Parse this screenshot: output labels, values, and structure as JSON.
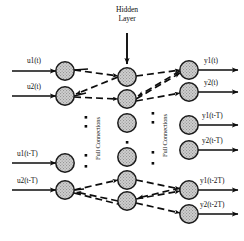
{
  "figure": {
    "title_line1": "Hidden",
    "title_line2": "Layer",
    "background_color": "#ffffff",
    "node_fill_color": "#c9c9c9",
    "node_stroke_color": "#1a1a1a",
    "line_color": "#0d0d0d"
  },
  "annotations": {
    "full_connections_left": "Full Connections",
    "full_connections_right": "Full Connections"
  },
  "inputs": [
    {
      "label": "u1(t)",
      "cx": 65,
      "cy": 71
    },
    {
      "label": "u2(t)",
      "cx": 65,
      "cy": 96
    },
    {
      "label": "u1(t-T)",
      "cx": 65,
      "cy": 163
    },
    {
      "label": "u2(t-T)",
      "cx": 65,
      "cy": 190
    }
  ],
  "hidden": [
    {
      "name": "hidden-node-1",
      "cx": 127,
      "cy": 77
    },
    {
      "name": "hidden-node-2",
      "cx": 127,
      "cy": 99
    },
    {
      "name": "hidden-node-3",
      "cx": 127,
      "cy": 123
    },
    {
      "name": "hidden-node-4",
      "cx": 127,
      "cy": 157
    },
    {
      "name": "hidden-node-5",
      "cx": 127,
      "cy": 180
    },
    {
      "name": "hidden-node-6",
      "cx": 127,
      "cy": 201
    }
  ],
  "outputs": [
    {
      "label": "y1(t)",
      "cx": 189,
      "cy": 70
    },
    {
      "label": "y2(t)",
      "cx": 189,
      "cy": 92
    },
    {
      "label": "y1(t-T)",
      "cx": 189,
      "cy": 125
    },
    {
      "label": "y2(t-T)",
      "cx": 189,
      "cy": 150
    },
    {
      "label": "y1(t-2T)",
      "cx": 189,
      "cy": 190
    },
    {
      "label": "y2(t-2T)",
      "cx": 189,
      "cy": 214
    }
  ],
  "ellipses": {
    "left_column_x": 86,
    "left_dots_y": [
      117,
      126,
      155,
      166
    ],
    "right_column_x": 153,
    "right_dots_y": [
      113,
      122,
      152,
      163
    ],
    "hidden_top_x": 127,
    "mid_dot_left": [
      86,
      141
    ],
    "mid_dot_right": [
      153,
      137
    ]
  }
}
